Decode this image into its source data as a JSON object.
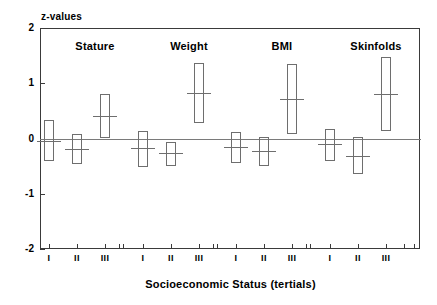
{
  "chart_data": {
    "type": "bar",
    "title": "",
    "subtitle": "",
    "ylabel": "z-values",
    "xlabel": "Socioeconomic Status (tertials)",
    "ylim": [
      -2,
      2
    ],
    "yticks": [
      2,
      1,
      0,
      -1,
      -2
    ],
    "ytick_labels": [
      "2",
      "1",
      "0",
      "-1",
      "-2"
    ],
    "grid": false,
    "legend": "none",
    "zero_reference_line": 0,
    "categories": [
      "I",
      "II",
      "III"
    ],
    "group_labels": [
      "Stature",
      "Weight",
      "BMI",
      "Skinfolds"
    ],
    "groups": [
      {
        "name": "Stature",
        "bars": [
          {
            "category": "I",
            "mean": -0.05,
            "low": -0.42,
            "high": 0.33
          },
          {
            "category": "II",
            "mean": -0.19,
            "low": -0.46,
            "high": 0.08
          },
          {
            "category": "III",
            "mean": 0.41,
            "low": 0.0,
            "high": 0.8
          }
        ]
      },
      {
        "name": "Weight",
        "bars": [
          {
            "category": "I",
            "mean": -0.18,
            "low": -0.51,
            "high": 0.14
          },
          {
            "category": "II",
            "mean": -0.26,
            "low": -0.5,
            "high": -0.07
          },
          {
            "category": "III",
            "mean": 0.83,
            "low": 0.28,
            "high": 1.37
          }
        ]
      },
      {
        "name": "BMI",
        "bars": [
          {
            "category": "I",
            "mean": -0.15,
            "low": -0.45,
            "high": 0.12
          },
          {
            "category": "II",
            "mean": -0.23,
            "low": -0.5,
            "high": 0.02
          },
          {
            "category": "III",
            "mean": 0.72,
            "low": 0.07,
            "high": 1.34
          }
        ]
      },
      {
        "name": "Skinfolds",
        "bars": [
          {
            "category": "I",
            "mean": -0.1,
            "low": -0.4,
            "high": 0.18
          },
          {
            "category": "II",
            "mean": -0.31,
            "low": -0.64,
            "high": 0.03
          },
          {
            "category": "III",
            "mean": 0.8,
            "low": 0.13,
            "high": 1.47
          }
        ]
      }
    ]
  },
  "style": {
    "box_stroke": "#6e6e6e",
    "axis_stroke": "#3a3a3a",
    "zero_line": "#7a7a7a",
    "background": "#ffffff",
    "text": "#000000"
  },
  "layout": {
    "plot_left": 40,
    "plot_top": 28,
    "plot_width": 380,
    "plot_height": 221,
    "box_width": 10,
    "mean_overhang": 7,
    "group_centers": [
      95,
      189,
      282,
      376
    ],
    "bar_x_centers": [
      [
        49,
        77,
        105
      ],
      [
        143,
        171,
        199
      ],
      [
        236,
        264,
        292
      ],
      [
        330,
        358,
        386
      ]
    ]
  }
}
